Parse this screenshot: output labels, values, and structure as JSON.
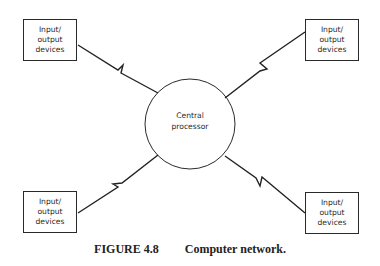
{
  "diagram": {
    "center_node": {
      "line1": "Central",
      "line2": "processor"
    },
    "peripheral_nodes": [
      {
        "position": "top-left",
        "line1": "Input/",
        "line2": "output",
        "line3": "devices"
      },
      {
        "position": "top-right",
        "line1": "Input/",
        "line2": "output",
        "line3": "devices"
      },
      {
        "position": "bottom-left",
        "line1": "Input/",
        "line2": "output",
        "line3": "devices"
      },
      {
        "position": "bottom-right",
        "line1": "Input/",
        "line2": "output",
        "line3": "devices"
      }
    ],
    "connections": [
      {
        "from": "top-left",
        "to": "center",
        "style": "lightning-link"
      },
      {
        "from": "top-right",
        "to": "center",
        "style": "lightning-link"
      },
      {
        "from": "bottom-left",
        "to": "center",
        "style": "lightning-link"
      },
      {
        "from": "bottom-right",
        "to": "center",
        "style": "lightning-link"
      }
    ]
  },
  "caption": {
    "figure_number": "FIGURE 4.8",
    "title": "Computer network."
  },
  "colors": {
    "line": "#2a2a2a",
    "background": "#ffffff"
  }
}
